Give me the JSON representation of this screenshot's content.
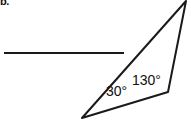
{
  "figure": {
    "item_marker": "b.",
    "background_color": "#ffffff",
    "stroke_color": "#1a1a1a",
    "text_color": "#111111",
    "width": 191,
    "height": 124,
    "reference_line": {
      "name": "horizontal-reference-segment",
      "x1": 4,
      "y1": 53,
      "x2": 124,
      "y2": 53
    },
    "triangle": {
      "name": "obtuse-triangle",
      "vertices": {
        "apex_top_right": {
          "x": 186,
          "y": 1
        },
        "vertex_bottom_left": {
          "x": 82,
          "y": 118
        },
        "vertex_right": {
          "x": 168,
          "y": 92
        }
      },
      "path": "M 186 1 L 82 118 L 168 92 Z"
    },
    "labels": {
      "angle_bottom_left": "30°",
      "angle_right": "130°"
    }
  }
}
